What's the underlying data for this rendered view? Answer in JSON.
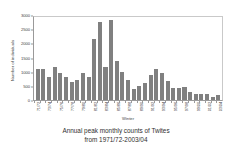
{
  "chart_data": {
    "type": "bar",
    "title": "Annual peak monthly counts of Twites from 1971/72-2003/04",
    "title_line1": "Annual peak monthly counts of Twites",
    "title_line2": "from 1971/72-2003/04",
    "xlabel": "Winter",
    "ylabel": "Number of individuals",
    "ylim": [
      0,
      3000
    ],
    "ytick_values": [
      0,
      500,
      1000,
      1500,
      2000,
      2500,
      3000
    ],
    "ytick_labels": [
      "0",
      "500",
      "1000",
      "1500",
      "2000",
      "2500",
      "3000"
    ],
    "grid": false,
    "legend": false,
    "bar_color": "#808080",
    "categories": [
      "71/72",
      "72/73",
      "73/74",
      "74/75",
      "75/76",
      "76/77",
      "77/78",
      "78/79",
      "79/80",
      "80/81",
      "81/82",
      "82/83",
      "83/84",
      "84/85",
      "85/86",
      "86/87",
      "87/88",
      "88/89",
      "89/90",
      "90/91",
      "91/92",
      "92/93",
      "93/94",
      "94/95",
      "95/96",
      "96/97",
      "97/98",
      "98/99",
      "99/00",
      "00/01",
      "01/02",
      "02/03",
      "03/04"
    ],
    "xtick_labels_shown": [
      "71/72",
      "73/74",
      "75/76",
      "77/78",
      "79/80",
      "81/82",
      "83/84",
      "85/86",
      "87/88",
      "89/90",
      "91/92",
      "93/94",
      "95/96",
      "97/98",
      "99/00",
      "01/02",
      "03/04"
    ],
    "values": [
      1100,
      1100,
      810,
      1180,
      970,
      810,
      630,
      720,
      960,
      820,
      2150,
      2750,
      1160,
      2820,
      1390,
      980,
      720,
      380,
      510,
      590,
      900,
      1080,
      940,
      680,
      440,
      440,
      470,
      280,
      200,
      200,
      200,
      100,
      160
    ]
  }
}
